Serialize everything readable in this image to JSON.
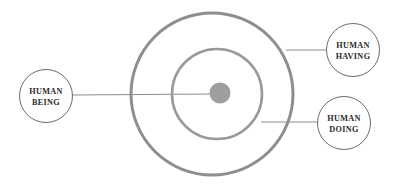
{
  "diagram": {
    "background_color": "#ffffff",
    "colors": {
      "outer_ring": "#8e8e8e",
      "middle_ring": "#9a9a9a",
      "center_dot_fill": "#9e9e9e",
      "node_outline": "#5a5a5a",
      "connector_line": "#8c8c8c",
      "label_text": "#2b2b2b"
    },
    "rings": [
      {
        "name": "outer-ring",
        "cx": 212,
        "cy": 94,
        "r": 81,
        "stroke_width": 3
      },
      {
        "name": "middle-ring",
        "cx": 217,
        "cy": 94,
        "r": 45,
        "stroke_width": 2.6
      }
    ],
    "center_dot": {
      "name": "center-dot",
      "cx": 220,
      "cy": 93,
      "r": 10.5
    },
    "nodes": [
      {
        "id": "human-being",
        "line1": "HUMAN",
        "line2": "BEING",
        "cx": 46,
        "cy": 96,
        "r": 26.5
      },
      {
        "id": "human-having",
        "line1": "HUMAN",
        "line2": "HAVING",
        "cx": 353,
        "cy": 50,
        "r": 26.5
      },
      {
        "id": "human-doing",
        "line1": "HUMAN",
        "line2": "DOING",
        "cx": 344,
        "cy": 123,
        "r": 26.5
      }
    ],
    "connectors": [
      {
        "id": "connector-being-to-center",
        "x1": 72.5,
        "y1": 95,
        "x2": 212,
        "y2": 94
      },
      {
        "id": "connector-having-to-outer",
        "x1": 326.5,
        "y1": 50,
        "x2": 286,
        "y2": 50
      },
      {
        "id": "connector-doing-to-middle",
        "x1": 317.5,
        "y1": 122,
        "x2": 261,
        "y2": 122
      }
    ]
  }
}
